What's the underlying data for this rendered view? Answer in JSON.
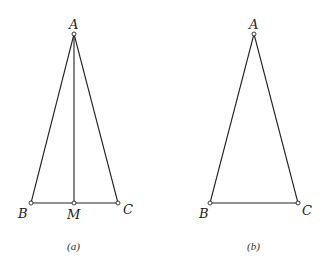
{
  "figures": [
    {
      "caption": "(a)",
      "points": {
        "A": {
          "label": "A",
          "x": 74,
          "y": 34
        },
        "B": {
          "label": "B",
          "x": 31,
          "y": 203
        },
        "M": {
          "label": "M",
          "x": 74,
          "y": 203
        },
        "C": {
          "label": "C",
          "x": 118,
          "y": 203
        }
      },
      "segments": [
        "AB",
        "AC",
        "BC",
        "AM"
      ]
    },
    {
      "caption": "(b)",
      "points": {
        "A": {
          "label": "A",
          "x": 254,
          "y": 34
        },
        "B": {
          "label": "B",
          "x": 210,
          "y": 203
        },
        "C": {
          "label": "C",
          "x": 298,
          "y": 203
        }
      },
      "segments": [
        "AB",
        "AC",
        "BC"
      ]
    }
  ],
  "colors": {
    "line": "#222222",
    "background": "#ffffff"
  }
}
